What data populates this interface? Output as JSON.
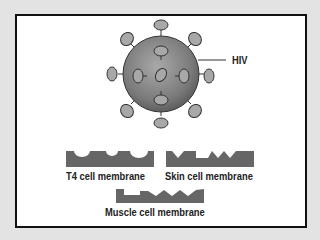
{
  "diagram": {
    "virus_label": "HIV",
    "membranes": [
      {
        "label": "T4 cell membrane",
        "shape": "rounded-notches"
      },
      {
        "label": "Skin cell membrane",
        "shape": "square-and-v-notches"
      },
      {
        "label": "Muscle cell membrane",
        "shape": "square-and-v-notches"
      }
    ],
    "colors": {
      "background": "#e3e3e3",
      "panel": "#ffffff",
      "virus_body": "#8a8a8a",
      "receptor": "#a8a8a8",
      "membrane": "#666666",
      "text": "#222222"
    }
  }
}
